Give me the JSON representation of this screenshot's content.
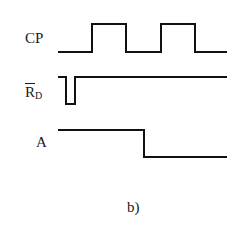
{
  "diagram": {
    "type": "timing-diagram",
    "caption": "b)",
    "signals": [
      {
        "name": "CP",
        "label_main": "CP",
        "description": "clock pulse: low, two positive pulses",
        "levels": [
          "low",
          "high",
          "low",
          "high",
          "low"
        ],
        "path": "M58,52 L92,52 L92,24 L126,24 L126,52 L161,52 L161,24 L195,24 L195,52 L227,52"
      },
      {
        "name": "RD_bar",
        "label_main": "R",
        "label_sub": "D",
        "overline": true,
        "description": "active-low reset: brief negative pulse at start, then high",
        "levels": [
          "high",
          "low",
          "high"
        ],
        "path": "M58,77 L66,77 L66,104 L75,104 L75,77 L227,77"
      },
      {
        "name": "A",
        "label_main": "A",
        "description": "output A: high, then falls low on second CP rising edge region",
        "levels": [
          "high",
          "low"
        ],
        "path": "M58,130 L144,130 L144,157 L227,157"
      }
    ],
    "stroke_color": "#111111",
    "background": "#ffffff"
  }
}
